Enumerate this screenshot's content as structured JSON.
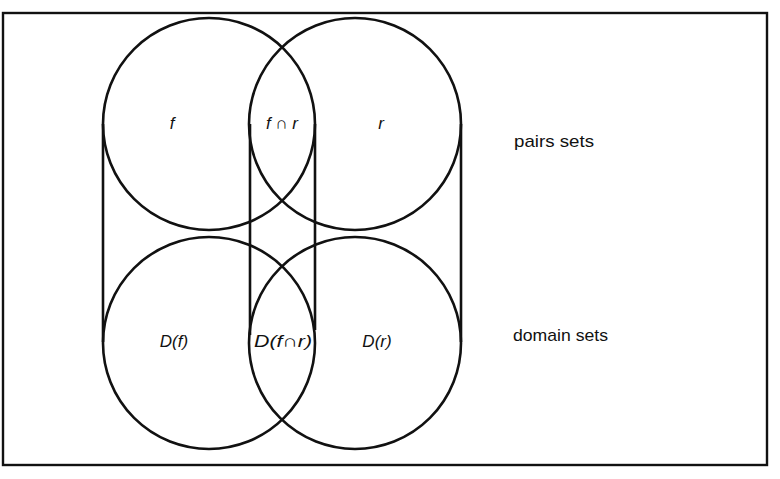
{
  "diagram": {
    "type": "venn-projection",
    "top_row": {
      "row_label": "pairs sets",
      "left_set": "f",
      "intersection": "f ∩ r",
      "right_set": "r"
    },
    "bottom_row": {
      "row_label": "domain sets",
      "left_set": "D(f)",
      "intersection": "D(f∩r)",
      "right_set": "D(r)"
    },
    "colors": {
      "line": "#111111",
      "background": "#ffffff"
    }
  }
}
